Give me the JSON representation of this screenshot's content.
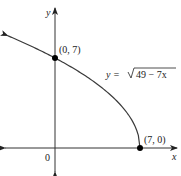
{
  "chart_data": {
    "type": "line",
    "title": "",
    "xlabel": "x",
    "ylabel": "y",
    "origin_label": "0",
    "function_label": "y = √(49 − 7x)",
    "equation": {
      "prefix": "y = ",
      "radicand": "49 − 7x"
    },
    "domain": [
      -3.9,
      7
    ],
    "xlim": [
      -4,
      10
    ],
    "ylim": [
      -2,
      11
    ],
    "grid": false,
    "series": [
      {
        "name": "y = sqrt(49 - 7x)",
        "x": [
          -3.9,
          -3,
          -2,
          -1,
          0,
          1,
          2,
          3,
          4,
          5,
          6,
          6.5,
          6.9,
          7
        ],
        "y": [
          8.73,
          8.4,
          7.94,
          7.48,
          7.0,
          6.48,
          5.92,
          5.29,
          4.58,
          3.74,
          2.65,
          1.87,
          0.84,
          0
        ]
      }
    ],
    "points": [
      {
        "label": "(0, 7)",
        "x": 0,
        "y": 7
      },
      {
        "label": "(7, 0)",
        "x": 7,
        "y": 0
      }
    ]
  }
}
